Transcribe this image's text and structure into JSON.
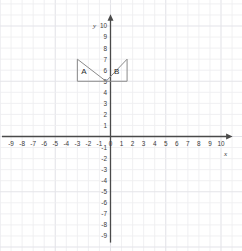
{
  "chart_data": {
    "type": "scatter",
    "title": "",
    "xlabel": "x",
    "ylabel": "y",
    "grid": true,
    "legend": "none",
    "xlim": [
      -10,
      10.6
    ],
    "ylim": [
      -9.6,
      10.6
    ],
    "x_tick_labels": [
      "-9",
      "-8",
      "-7",
      "-6",
      "-5",
      "-4",
      "-3",
      "-2",
      "-1",
      "0",
      "1",
      "2",
      "3",
      "4",
      "5",
      "6",
      "7",
      "8",
      "9",
      "10"
    ],
    "x_tick_values": [
      -9,
      -8,
      -7,
      -6,
      -5,
      -4,
      -3,
      -2,
      -1,
      0,
      1,
      2,
      3,
      4,
      5,
      6,
      7,
      8,
      9,
      10
    ],
    "y_tick_labels": [
      "10",
      "9",
      "8",
      "7",
      "6",
      "5",
      "4",
      "3",
      "2",
      "1",
      "-1",
      "-2",
      "-3",
      "-4",
      "-5",
      "-6",
      "-7",
      "-8",
      "-9"
    ],
    "y_tick_values": [
      10,
      9,
      8,
      7,
      6,
      5,
      4,
      3,
      2,
      1,
      -1,
      -2,
      -3,
      -4,
      -5,
      -6,
      -7,
      -8,
      -9
    ],
    "origin_label": "0",
    "shapes": [
      {
        "label": "A",
        "kind": "triangle",
        "vertices": [
          [
            -3,
            7
          ],
          [
            -3,
            5
          ],
          [
            -0.4,
            5
          ]
        ],
        "label_position": [
          -2.4,
          5.9
        ]
      },
      {
        "label": "B",
        "kind": "triangle",
        "vertices": [
          [
            1.5,
            7
          ],
          [
            1.5,
            5
          ],
          [
            -0.4,
            5
          ]
        ],
        "label_position": [
          0.55,
          5.9
        ]
      }
    ]
  },
  "colors": {
    "grid_line": "#ededf0",
    "grid_line_major": "#e4e4e9",
    "axis": "#4a4a4a",
    "shape_stroke": "#8a8a8a",
    "tick_text": "#3a3a3a",
    "background": "#ffffff"
  }
}
